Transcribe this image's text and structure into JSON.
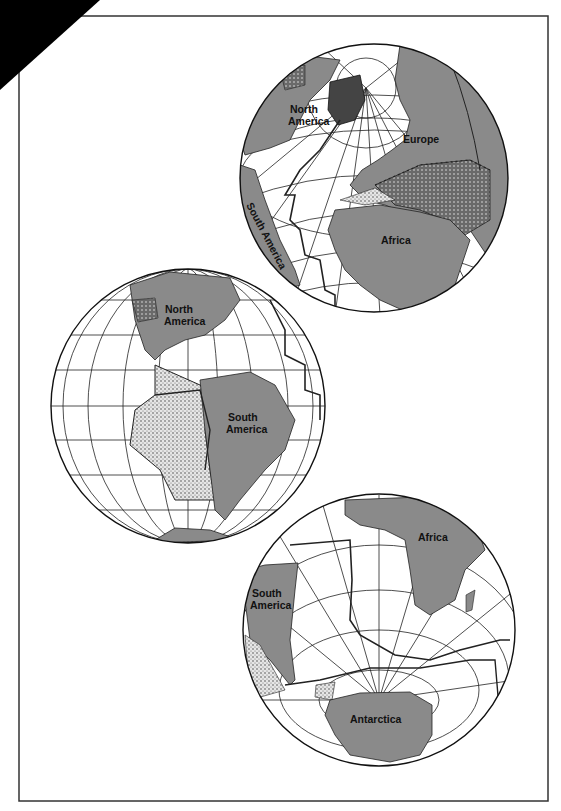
{
  "figure": {
    "colors": {
      "land": "#8a8a8a",
      "ocean": "#ffffff",
      "line": "#1a1a1a",
      "stipple_light": "#d8d8d8",
      "stipple_dark": "#5c5c5c",
      "corner": "#000000"
    },
    "globes": [
      {
        "id": "north-atlantic",
        "labels": {
          "na": "North",
          "na2": "America",
          "eu": "Europe",
          "af": "Africa",
          "sa": "South America"
        }
      },
      {
        "id": "americas",
        "labels": {
          "na": "North",
          "na2": "America",
          "sa": "South",
          "sa2": "America"
        }
      },
      {
        "id": "south-atlantic",
        "labels": {
          "af": "Africa",
          "sa": "South",
          "sa2": "America",
          "an": "Antarctica"
        }
      }
    ]
  }
}
